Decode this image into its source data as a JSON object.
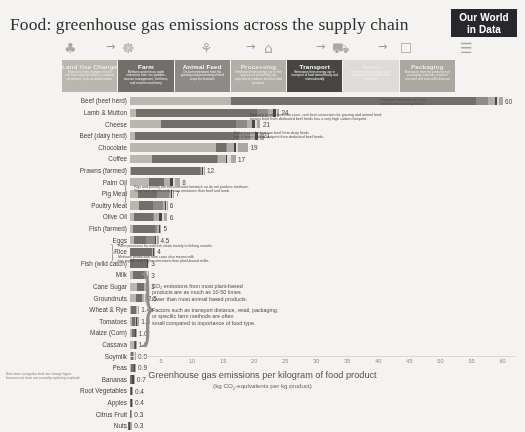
{
  "header": {
    "title": "Food: greenhouse gas emissions across the supply chain",
    "logo_line1": "Our World",
    "logo_line2": "in Data"
  },
  "pictograms": [
    {
      "name": "land-use-icon",
      "glyph": "♣"
    },
    {
      "name": "arrow-1-icon",
      "glyph": "→"
    },
    {
      "name": "farm-icon",
      "glyph": "☸"
    },
    {
      "name": "animal-feed-icon",
      "glyph": "⚘"
    },
    {
      "name": "arrow-2-icon",
      "glyph": "→"
    },
    {
      "name": "processing-icon",
      "glyph": "⌂"
    },
    {
      "name": "arrow-3-icon",
      "glyph": "→"
    },
    {
      "name": "transport-icon",
      "glyph": "⛟"
    },
    {
      "name": "arrow-4-icon",
      "glyph": "→"
    },
    {
      "name": "retail-icon",
      "glyph": "☐"
    },
    {
      "name": "packaging-icon",
      "glyph": "☰"
    }
  ],
  "supply_chain": {
    "segments": [
      {
        "label": "Land Use Change",
        "description": "Emissions from changes in land use from natural habitat to cropland or pasture, such as deforestation",
        "color": "#b9b4ad",
        "text_tone": "light"
      },
      {
        "label": "Farm",
        "description": "Methane and nitrous oxide emissions from rice paddies, manure management, fertilizers, and on-farm machinery",
        "color": "#6e6b67",
        "text_tone": "dark"
      },
      {
        "label": "Animal Feed",
        "description": "On-farm emissions from the growing and processing of feed crops for livestock",
        "color": "#8a8782",
        "text_tone": "dark"
      },
      {
        "label": "Processing",
        "description": "Emissions from energy use in the process of converting raw agricultural products into final food products",
        "color": "#b0aca5",
        "text_tone": "light"
      },
      {
        "label": "Transport",
        "description": "Emissions from energy use in transport of food domestically and internationally",
        "color": "#454341",
        "text_tone": "dark"
      },
      {
        "label": "Retail",
        "description": "Emissions from energy use in refrigeration and other retail processes",
        "color": "#dedbd6",
        "text_tone": "light"
      },
      {
        "label": "Packaging",
        "description": "Emissions from the production of packaging materials, material transport and end-of-life disposal",
        "color": "#a8a49e",
        "text_tone": "light"
      }
    ]
  },
  "annotations": {
    "transport": "Transport emissions are very\nsmall for most food products",
    "beef_herd": "Methane production from cows, and land conversion for grazing and animal feed\nmeans beef from dedicated beef herds has a very high carbon footprint.",
    "dairy_herd": "Dairy co-products mean beef from dairy herds\nhas a lower carbon footprint than dedicated beef herds.",
    "pig_poultry": "Pigs and poultry are non-ruminant livestock so do not produce methane.\nThey have significantly lower emissions than beef and lamb.",
    "fish_wild": "Farm pressures for wild fish relate mainly to fishing vessels.",
    "milk": "Methane production from cows also means milk\nhas significantly higher emissions than plant-based milks.",
    "co2_plant": "CO₂ emissions from most plant-based\nproducts are as much as 10-50 times\nlower than most animal based products.",
    "factors": "Factors such as transport distance, retail, packaging,\nor specific farm methods are often\nsmall compared to importance of food type.",
    "footnote": "Nuts have a negative land use change figure\nbecause nut trees are currently replacing cropland."
  },
  "chart_data": {
    "type": "bar",
    "orientation": "horizontal",
    "stacked": true,
    "title": "Food: greenhouse gas emissions across the supply chain",
    "xlabel": "Greenhouse gas emissions per kilogram of food product",
    "xlabel_sub": "(kg CO₂-equivalents per kg product)",
    "ylabel": "",
    "xlim": [
      0,
      62
    ],
    "xticks": [
      5,
      10,
      15,
      20,
      25,
      30,
      35,
      40,
      45,
      50,
      55,
      60
    ],
    "grid": false,
    "series_names": [
      "Land Use Change",
      "Farm",
      "Animal Feed",
      "Processing",
      "Transport",
      "Retail",
      "Packaging"
    ],
    "series_colors": [
      "#b9b4ad",
      "#6e6b67",
      "#8a8782",
      "#b0aca5",
      "#454341",
      "#dedbd6",
      "#a8a49e"
    ],
    "categories": [
      "Beef (beef herd)",
      "Lamb & Mutton",
      "Cheese",
      "Beef (dairy herd)",
      "Chocolate",
      "Coffee",
      "Prawns (farmed)",
      "Palm Oil",
      "Pig Meat",
      "Poultry Meat",
      "Olive Oil",
      "Fish (farmed)",
      "Eggs",
      "Rice",
      "Fish (wild catch)",
      "Milk",
      "Cane Sugar",
      "Groundnuts",
      "Wheat & Rye",
      "Tomatoes",
      "Maize (Corn)",
      "Cassava",
      "Soymilk",
      "Peas",
      "Bananas",
      "Root Vegetables",
      "Apples",
      "Citrus Fruit",
      "Nuts"
    ],
    "values": [
      60,
      24,
      21,
      21,
      19,
      17,
      12,
      8,
      7,
      6,
      6,
      5,
      4.5,
      4,
      3,
      3,
      3,
      2.5,
      1.4,
      1.4,
      1.0,
      1.0,
      0.9,
      0.9,
      0.7,
      0.4,
      0.4,
      0.3,
      0.3
    ],
    "value_labels": [
      "60",
      "24",
      "21",
      "21",
      "19",
      "17",
      "12",
      "8",
      "7",
      "6",
      "6",
      "5",
      "4.5",
      "4",
      "3",
      "3",
      "3",
      "2.5",
      "1.4",
      "1.4",
      "1.0",
      "1.0",
      "0.9",
      "0.9",
      "0.7",
      "0.4",
      "0.4",
      "0.3",
      "0.3"
    ],
    "segments": [
      [
        16.3,
        39.4,
        1.9,
        1.1,
        0.4,
        0.3,
        0.6
      ],
      [
        0.9,
        19.5,
        1.9,
        0.7,
        0.5,
        0.2,
        0.3
      ],
      [
        5.0,
        12.0,
        1.8,
        0.9,
        0.4,
        0.3,
        0.6
      ],
      [
        0.8,
        16.8,
        1.7,
        0.9,
        0.4,
        0.3,
        0.6
      ],
      [
        13.9,
        1.5,
        0.2,
        1.1,
        0.3,
        0.4,
        1.6
      ],
      [
        3.6,
        10.4,
        0.1,
        1.3,
        0.2,
        0.6,
        0.8
      ],
      [
        0.2,
        11.0,
        0.2,
        0.2,
        0.2,
        0.1,
        0.1
      ],
      [
        3.1,
        2.3,
        0.1,
        1.0,
        0.5,
        0.3,
        0.7
      ],
      [
        1.3,
        3.0,
        2.0,
        0.3,
        0.2,
        0.1,
        0.1
      ],
      [
        1.5,
        2.2,
        1.6,
        0.3,
        0.2,
        0.1,
        0.1
      ],
      [
        0.7,
        3.0,
        0.1,
        0.9,
        0.5,
        0.3,
        0.5
      ],
      [
        0.5,
        3.5,
        0.4,
        0.2,
        0.2,
        0.1,
        0.1
      ],
      [
        0.6,
        1.9,
        1.5,
        0.1,
        0.1,
        0.1,
        0.3
      ],
      [
        0.0,
        3.6,
        0.0,
        0.1,
        0.1,
        0.1,
        0.1
      ],
      [
        0.0,
        2.7,
        0.0,
        0.1,
        0.1,
        0.1,
        0.0
      ],
      [
        0.5,
        1.7,
        0.4,
        0.1,
        0.1,
        0.1,
        0.1
      ],
      [
        1.2,
        1.0,
        0.0,
        0.4,
        0.2,
        0.1,
        0.1
      ],
      [
        0.9,
        1.1,
        0.0,
        0.2,
        0.1,
        0.1,
        0.1
      ],
      [
        0.1,
        0.8,
        0.0,
        0.2,
        0.1,
        0.1,
        0.1
      ],
      [
        0.3,
        0.5,
        0.0,
        0.1,
        0.2,
        0.1,
        0.2
      ],
      [
        0.3,
        0.5,
        0.0,
        0.0,
        0.1,
        0.0,
        0.1
      ],
      [
        0.6,
        0.2,
        0.0,
        0.0,
        0.1,
        0.0,
        0.1
      ],
      [
        0.2,
        0.3,
        0.0,
        0.1,
        0.1,
        0.1,
        0.1
      ],
      [
        0.1,
        0.6,
        0.0,
        0.0,
        0.1,
        0.0,
        0.1
      ],
      [
        0.0,
        0.3,
        0.0,
        0.0,
        0.3,
        0.0,
        0.1
      ],
      [
        0.0,
        0.2,
        0.0,
        0.0,
        0.1,
        0.0,
        0.1
      ],
      [
        0.0,
        0.2,
        0.0,
        0.0,
        0.1,
        0.0,
        0.1
      ],
      [
        0.0,
        0.1,
        0.0,
        0.0,
        0.1,
        0.0,
        0.1
      ],
      [
        -0.3,
        0.2,
        0.0,
        0.0,
        0.1,
        0.0,
        0.3
      ]
    ]
  }
}
